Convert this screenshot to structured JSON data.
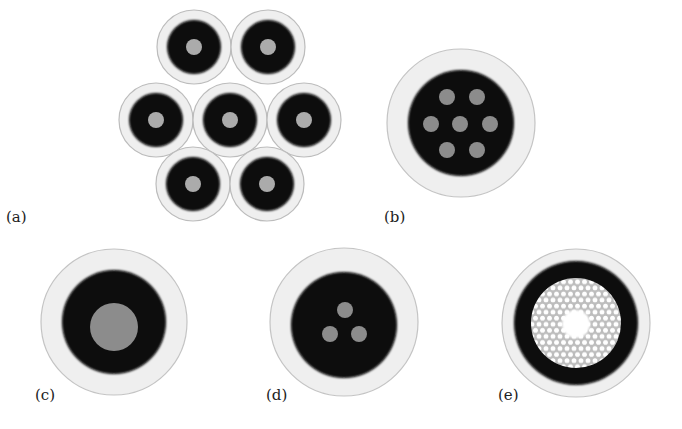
{
  "figure": {
    "colors": {
      "cladding_coating": "#ededed",
      "coating_edge": "#b8b8b8",
      "jacket": "#060606",
      "core": "#a9a9a9",
      "core_dark": "#8a8a8a",
      "hole_region": "#cfcfcf",
      "air_hole": "#ffffff"
    },
    "panels": [
      {
        "id": "a",
        "label": "(a)",
        "type": "fiber-bundle",
        "fiber_count": 7
      },
      {
        "id": "b",
        "label": "(b)",
        "type": "multicore-fiber",
        "core_count": 7
      },
      {
        "id": "c",
        "label": "(c)",
        "type": "single-core-fiber",
        "core_count": 1
      },
      {
        "id": "d",
        "label": "(d)",
        "type": "few-core-fiber",
        "core_count": 3
      },
      {
        "id": "e",
        "label": "(e)",
        "type": "hollow-core-photonic-crystal-fiber"
      }
    ]
  }
}
